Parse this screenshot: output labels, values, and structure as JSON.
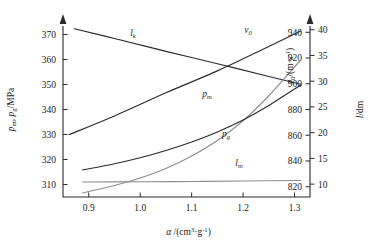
{
  "chart_data": {
    "type": "line",
    "title": "",
    "xlabel": "a /(cm3·g-1)",
    "xlabel_parts": {
      "sym": "α",
      "slash": " /(cm",
      "sup1": "3",
      "mid": "·g",
      "sup2": "-1",
      "close": ")"
    },
    "xlim": [
      0.85,
      1.33
    ],
    "xticks": [
      0.9,
      1.0,
      1.1,
      1.2,
      1.3
    ],
    "xtick_labels": [
      "0.9",
      "1.0",
      "1.1",
      "1.2",
      "1.3"
    ],
    "grid": false,
    "legend": "inline curve labels",
    "axes": [
      {
        "id": "left",
        "position": "left",
        "label": "p_m, p_g/MPa",
        "label_parts": {
          "p1": "p",
          "s1": "m",
          "comma": ", ",
          "p2": "p",
          "s2": "g",
          "unit": "/MPa"
        },
        "lim": [
          305,
          375
        ],
        "ticks": [
          310,
          320,
          330,
          340,
          350,
          360,
          370
        ],
        "tick_labels": [
          "310",
          "320",
          "330",
          "340",
          "350",
          "360",
          "370"
        ]
      },
      {
        "id": "right-inner",
        "position": "right-inner",
        "label": "v_0/(m·s-1)",
        "label_parts": {
          "v": "v",
          "s": "0",
          "unit": "/(m·s",
          "sup": "-1",
          "close": ")"
        },
        "lim": [
          812,
          948
        ],
        "ticks": [
          820,
          840,
          860,
          880,
          900,
          920,
          940
        ],
        "tick_labels": [
          "820",
          "840",
          "860",
          "880",
          "900",
          "920",
          "940"
        ]
      },
      {
        "id": "right-outer",
        "position": "right-outer",
        "label": "l/dm",
        "label_parts": {
          "l": "l",
          "unit": "/dm"
        },
        "lim": [
          7.5,
          41.5
        ],
        "ticks": [
          10,
          15,
          20,
          25,
          30,
          35,
          40
        ],
        "tick_labels": [
          "10",
          "15",
          "20",
          "25",
          "30",
          "35",
          "40"
        ]
      }
    ],
    "series": [
      {
        "name": "l_k",
        "label_parts": {
          "base": "l",
          "sub": "k"
        },
        "axis": "right-outer",
        "color": "#2b2b2b",
        "x": [
          0.872,
          0.95,
          1.05,
          1.15,
          1.25,
          1.312
        ],
        "values": [
          40.2,
          38.3,
          35.8,
          33.4,
          30.9,
          29.4
        ]
      },
      {
        "name": "v_0",
        "label_parts": {
          "base": "v",
          "sub": "0"
        },
        "axis": "right-inner",
        "color": "#2b2b2b",
        "x": [
          0.862,
          0.95,
          1.05,
          1.15,
          1.25,
          1.312
        ],
        "values": [
          860.5,
          875.0,
          893.0,
          910.0,
          929.0,
          941.0
        ]
      },
      {
        "name": "p_m",
        "label_parts": {
          "base": "p",
          "sub": "m"
        },
        "axis": "left",
        "color": "#8d8d8d",
        "x": [
          0.888,
          0.95,
          1.0,
          1.05,
          1.1,
          1.15,
          1.2,
          1.25,
          1.312
        ],
        "values": [
          306.6,
          309.6,
          312.6,
          316.4,
          321.4,
          327.6,
          335.5,
          345.5,
          359.8
        ]
      },
      {
        "name": "p_g",
        "label_parts": {
          "base": "p",
          "sub": "g"
        },
        "axis": "left",
        "color": "#2b2b2b",
        "x": [
          0.888,
          0.95,
          1.0,
          1.05,
          1.1,
          1.15,
          1.2,
          1.25,
          1.312
        ],
        "values": [
          315.8,
          318.3,
          320.7,
          323.6,
          327.0,
          331.0,
          335.8,
          341.6,
          349.8
        ]
      },
      {
        "name": "l_m",
        "label_parts": {
          "base": "l",
          "sub": "m"
        },
        "axis": "left",
        "color": "#8d8d8d",
        "x": [
          0.888,
          1.0,
          1.1,
          1.2,
          1.312
        ],
        "values": [
          311.0,
          311.1,
          311.2,
          311.4,
          311.6
        ]
      }
    ]
  }
}
